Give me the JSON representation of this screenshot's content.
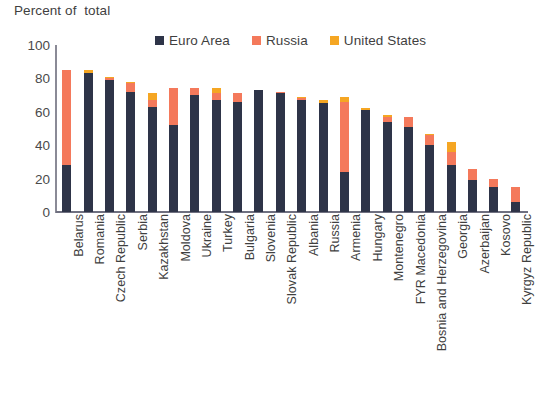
{
  "title": "Percent of  total",
  "legend": {
    "position": "top",
    "items": [
      {
        "label": "Euro Area",
        "color": "#2E3448",
        "swatch_icon": "square-swatch"
      },
      {
        "label": "Russia",
        "color": "#F4795B",
        "swatch_icon": "square-swatch"
      },
      {
        "label": "United States",
        "color": "#F5A623",
        "swatch_icon": "square-swatch"
      }
    ]
  },
  "axis": {
    "y_ticks": [
      "0",
      "20",
      "40",
      "60",
      "80",
      "100"
    ],
    "y_min": 0,
    "y_max": 100
  },
  "chart_data": {
    "type": "bar",
    "title": "Percent of  total",
    "subtitle": "",
    "xlabel": "",
    "ylabel": "Percent of  total",
    "ylim": [
      0,
      100
    ],
    "grid": false,
    "stacked": true,
    "legend_position": "top",
    "categories": [
      "Belarus",
      "Romania",
      "Czech Republic",
      "Serbia",
      "Kazakhstan",
      "Moldova",
      "Ukraine",
      "Turkey",
      "Bulgaria",
      "Slovenia",
      "Slovak Republic",
      "Albania",
      "Russia",
      "Armenia",
      "Hungary",
      "Montenegro",
      "FYR Macedonia",
      "Bosnia and Herzegovina",
      "Georgia",
      "Azerbaijan",
      "Kosovo",
      "Kyrgyz Republic"
    ],
    "series": [
      {
        "name": "Euro Area",
        "color": "#2E3448",
        "values": [
          28,
          83,
          79,
          72,
          63,
          52,
          70,
          67,
          66,
          73,
          71,
          67,
          65,
          24,
          61,
          54,
          51,
          40,
          28,
          19,
          15,
          6
        ]
      },
      {
        "name": "Russia",
        "color": "#F4795B",
        "values": [
          57,
          0,
          1,
          5,
          4,
          22,
          4,
          4,
          5,
          0,
          1,
          1,
          0,
          42,
          0,
          3,
          6,
          6,
          8,
          7,
          5,
          9
        ]
      },
      {
        "name": "United States",
        "color": "#F5A623",
        "values": [
          0,
          2,
          1,
          1,
          4,
          0,
          0,
          3,
          0,
          0,
          0,
          1,
          2,
          3,
          1,
          1,
          0,
          1,
          6,
          0,
          0,
          0
        ]
      }
    ],
    "totals": [
      85,
      85,
      81,
      78,
      71,
      74,
      74,
      74,
      71,
      73,
      72,
      69,
      67,
      69,
      62,
      58,
      57,
      47,
      42,
      26,
      20,
      15
    ]
  }
}
